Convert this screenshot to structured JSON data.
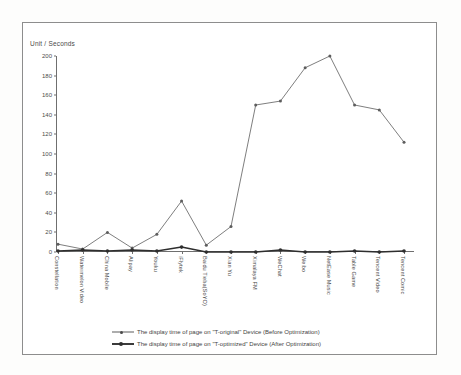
{
  "chart_data": {
    "type": "line",
    "title": "",
    "subtitle": "",
    "xlabel": "",
    "ylabel": "Unit / Seconds",
    "ylim": [
      0,
      200
    ],
    "yticks": [
      0,
      20,
      40,
      60,
      80,
      100,
      120,
      140,
      160,
      180,
      200
    ],
    "grid": false,
    "legend_position": "bottom",
    "categories": [
      "Constellation",
      "Watermelon Video",
      "China Mobile",
      "Alipay",
      "Youku",
      "iFlytek",
      "Baidu Tieba(SoYO)",
      "Xian Yu",
      "Ximalaya FM",
      "WeChat",
      "Weibo",
      "NetEase Music",
      "Table Game",
      "Tencent Video",
      "Tencent Comic"
    ],
    "series": [
      {
        "name": "The display time of page on \"T-original\" Device (Before Optimization)",
        "values": [
          8,
          3,
          20,
          4,
          18,
          52,
          7,
          26,
          150,
          154,
          188,
          200,
          150,
          145,
          112
        ]
      },
      {
        "name": "The display time of page on \"T-optimized\" Device (After Optimization)",
        "values": [
          1,
          2,
          1,
          2,
          1,
          5,
          0,
          0,
          0,
          2,
          0,
          0,
          1,
          0,
          1
        ]
      }
    ],
    "colors": {
      "series_before": "#5d5d5d",
      "series_after": "#2e2e2e",
      "axis": "#6f6f6f",
      "frame": "#8d8d8d",
      "text": "#4a4a4a"
    }
  },
  "legend": {
    "items": [
      {
        "label": "The display time of page on \"T-original\" Device (Before Optimization)"
      },
      {
        "label": "The display time of page on \"T-optimized\" Device (After Optimization)"
      }
    ]
  }
}
